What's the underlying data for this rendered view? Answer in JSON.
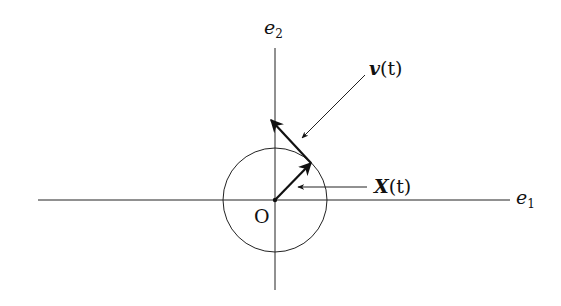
{
  "figure": {
    "type": "vector-diagram",
    "origin": {
      "label": "O",
      "x": 275,
      "y": 200
    },
    "axes": {
      "horizontal": {
        "label_base": "e",
        "label_sub": "1",
        "x1": 38,
        "x2": 510,
        "y": 200
      },
      "vertical": {
        "label_base": "e",
        "label_sub": "2",
        "x": 275,
        "y1": 48,
        "y2": 290
      }
    },
    "circle": {
      "cx": 275,
      "cy": 200,
      "r": 52
    },
    "vectors": [
      {
        "name": "X(t)",
        "label_bold": "X",
        "label_arg": "(t)",
        "from": [
          275,
          200
        ],
        "to": [
          311,
          163
        ]
      },
      {
        "name": "v(t)",
        "label_bold": "v",
        "label_arg": "(t)",
        "from": [
          311,
          163
        ],
        "to": [
          271,
          120
        ]
      }
    ],
    "pointers": [
      {
        "target": "v(t)",
        "from": [
          365,
          75
        ],
        "to": [
          302,
          138
        ]
      },
      {
        "target": "X(t)",
        "from": [
          367,
          187
        ],
        "to": [
          298,
          187
        ]
      }
    ],
    "colors": {
      "ink": "#111111",
      "background": "#ffffff"
    }
  }
}
